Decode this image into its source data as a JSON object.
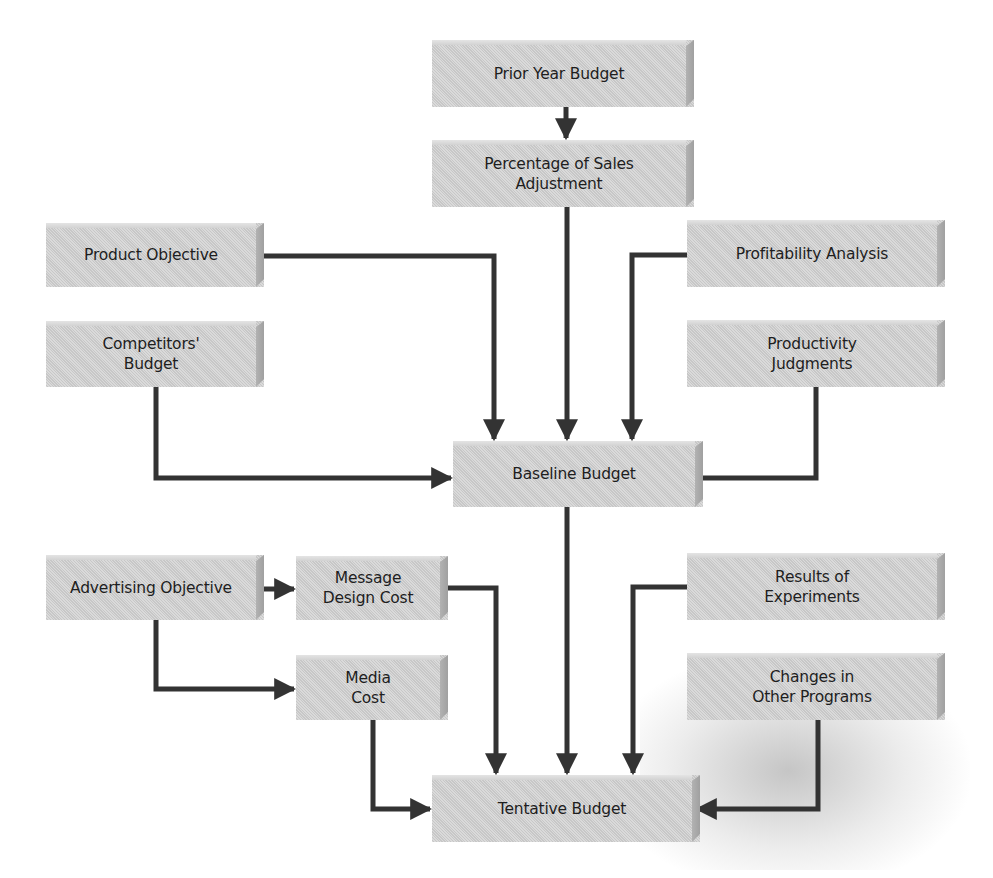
{
  "diagram": {
    "colors": {
      "box_fill": "#d2d2d2",
      "box_side": "#a8a8a8",
      "connector": "#333333",
      "text": "#1e1e1e",
      "background": "#ffffff"
    },
    "nodes": {
      "prior_year_budget": "Prior Year Budget",
      "percentage_of_sales_adjustment": "Percentage of Sales\nAdjustment",
      "product_objective": "Product Objective",
      "competitors_budget": "Competitors'\nBudget",
      "profitability_analysis": "Profitability Analysis",
      "productivity_judgments": "Productivity\nJudgments",
      "baseline_budget": "Baseline Budget",
      "advertising_objective": "Advertising Objective",
      "message_design_cost": "Message\nDesign Cost",
      "media_cost": "Media\nCost",
      "results_of_experiments": "Results of\nExperiments",
      "changes_in_other_programs": "Changes in\nOther Programs",
      "tentative_budget": "Tentative Budget"
    },
    "edges": [
      {
        "from": "Prior Year Budget",
        "to": "Percentage of Sales Adjustment"
      },
      {
        "from": "Percentage of Sales Adjustment",
        "to": "Baseline Budget"
      },
      {
        "from": "Product Objective",
        "to": "Baseline Budget"
      },
      {
        "from": "Competitors' Budget",
        "to": "Baseline Budget"
      },
      {
        "from": "Profitability Analysis",
        "to": "Baseline Budget"
      },
      {
        "from": "Productivity Judgments",
        "to": "Baseline Budget"
      },
      {
        "from": "Baseline Budget",
        "to": "Tentative Budget"
      },
      {
        "from": "Advertising Objective",
        "to": "Message Design Cost"
      },
      {
        "from": "Advertising Objective",
        "to": "Media Cost"
      },
      {
        "from": "Message Design Cost",
        "to": "Tentative Budget"
      },
      {
        "from": "Media Cost",
        "to": "Tentative Budget"
      },
      {
        "from": "Results of Experiments",
        "to": "Tentative Budget"
      },
      {
        "from": "Changes in Other Programs",
        "to": "Tentative Budget"
      }
    ]
  }
}
